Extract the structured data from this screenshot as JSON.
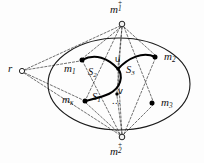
{
  "figure": {
    "background_color": "#fdfdfd",
    "stroke_color": "#111111"
  },
  "nodes": {
    "root": {
      "id": "r",
      "label": "r",
      "shape": "small-circle",
      "x": 22,
      "y": 71,
      "label_x": 8,
      "label_y": 64
    },
    "top_hub": {
      "id": "m1plus",
      "base": "m",
      "sub": "1",
      "sup": "+",
      "shape": "small-circle",
      "x": 122,
      "y": 24,
      "label_x": 110,
      "label_y": 2
    },
    "bottom_hub": {
      "id": "m2plus",
      "base": "m",
      "sub": "2",
      "sup": "+",
      "shape": "small-circle",
      "x": 122,
      "y": 137,
      "label_x": 110,
      "label_y": 143
    },
    "terminals": [
      {
        "id": "m1",
        "base": "m",
        "sub": "1",
        "x": 82,
        "y": 60,
        "label_x": 66,
        "label_y": 64
      },
      {
        "id": "m2",
        "base": "m",
        "sub": "2",
        "x": 155,
        "y": 57,
        "label_x": 164,
        "label_y": 52
      },
      {
        "id": "m3",
        "base": "m",
        "sub": "3",
        "x": 152,
        "y": 103,
        "label_x": 162,
        "label_y": 98
      },
      {
        "id": "mk",
        "base": "m",
        "sub": "κ",
        "x": 85,
        "y": 101,
        "label_x": 63,
        "label_y": 95
      }
    ],
    "inner": [
      {
        "id": "u",
        "label": "u",
        "x": 118,
        "y": 69,
        "label_x": 114,
        "label_y": 55
      },
      {
        "id": "v",
        "label": "v",
        "x": 117,
        "y": 94,
        "label_x": 118,
        "label_y": 88
      }
    ]
  },
  "set_labels": [
    {
      "id": "S1",
      "base": "S",
      "sub": "1",
      "x": 98,
      "y": 95
    },
    {
      "id": "S2",
      "base": "S",
      "sub": "2",
      "x": 94,
      "y": 70
    },
    {
      "id": "S3",
      "base": "S",
      "sub": "3",
      "x": 131,
      "y": 68
    }
  ],
  "ellipsis": {
    "text": "...",
    "x": 119,
    "y": 98
  },
  "ellipse": {
    "cx": 119,
    "cy": 84,
    "rx": 71,
    "ry": 46
  },
  "legend": {
    "solid_edges": "thick solid curved edges",
    "dashed_edges": "thin dashed edges"
  }
}
